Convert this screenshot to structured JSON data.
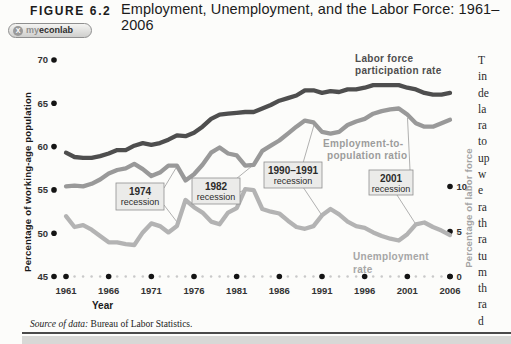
{
  "figure": {
    "label": "FIGURE 6.2",
    "title": "Employment, Unemployment, and the Labor Force: 1961–2006",
    "badge": {
      "mark": "X",
      "prefix": "my",
      "mid": "econ",
      "suffix": "lab"
    },
    "source_prefix": "Source of data:",
    "source_text": "Bureau of Labor Statistics."
  },
  "chart_data": {
    "type": "line",
    "title": "Employment, Unemployment, and the Labor Force: 1961–2006",
    "years": [
      1961,
      1962,
      1963,
      1964,
      1965,
      1966,
      1967,
      1968,
      1969,
      1970,
      1971,
      1972,
      1973,
      1974,
      1975,
      1976,
      1977,
      1978,
      1979,
      1980,
      1981,
      1982,
      1983,
      1984,
      1985,
      1986,
      1987,
      1988,
      1989,
      1990,
      1991,
      1992,
      1993,
      1994,
      1995,
      1996,
      1997,
      1998,
      1999,
      2000,
      2001,
      2002,
      2003,
      2004,
      2005,
      2006
    ],
    "series": [
      {
        "name": "Labor force participation rate",
        "axis": "left",
        "color": "#4e4e4e",
        "values": [
          59.3,
          58.8,
          58.7,
          58.7,
          58.9,
          59.2,
          59.6,
          59.6,
          60.1,
          60.4,
          60.2,
          60.4,
          60.8,
          61.3,
          61.2,
          61.6,
          62.3,
          63.2,
          63.7,
          63.8,
          63.9,
          64.0,
          64.0,
          64.4,
          64.8,
          65.3,
          65.6,
          65.9,
          66.5,
          66.5,
          66.2,
          66.4,
          66.3,
          66.6,
          66.6,
          66.8,
          67.1,
          67.1,
          67.1,
          67.1,
          66.8,
          66.6,
          66.2,
          66.0,
          66.0,
          66.2
        ]
      },
      {
        "name": "Employment-to-population ratio",
        "axis": "left",
        "color": "#999999",
        "values": [
          55.4,
          55.5,
          55.4,
          55.7,
          56.2,
          56.9,
          57.3,
          57.5,
          58.0,
          57.4,
          56.6,
          57.0,
          57.8,
          57.8,
          56.1,
          56.8,
          57.9,
          59.3,
          59.9,
          59.2,
          59.0,
          57.8,
          57.9,
          59.5,
          60.1,
          60.7,
          61.5,
          62.3,
          63.0,
          62.8,
          61.7,
          61.5,
          61.7,
          62.5,
          62.9,
          63.2,
          63.8,
          64.1,
          64.3,
          64.4,
          63.7,
          62.7,
          62.3,
          62.3,
          62.7,
          63.1
        ]
      },
      {
        "name": "Unemployment rate",
        "axis": "right",
        "color": "#b3b3b3",
        "values": [
          6.7,
          5.5,
          5.7,
          5.2,
          4.5,
          3.8,
          3.8,
          3.6,
          3.5,
          4.9,
          5.9,
          5.6,
          4.9,
          5.6,
          8.5,
          7.7,
          7.1,
          6.1,
          5.8,
          7.1,
          7.6,
          9.7,
          9.6,
          7.5,
          7.2,
          7.0,
          6.2,
          5.5,
          5.3,
          5.6,
          6.8,
          7.5,
          6.9,
          6.1,
          5.6,
          5.4,
          4.9,
          4.5,
          4.2,
          4.0,
          4.7,
          5.8,
          6.0,
          5.5,
          5.1,
          4.6
        ]
      }
    ],
    "left_axis": {
      "label": "Percentage of working-age population",
      "ticks": [
        70,
        65,
        60,
        55,
        50,
        45
      ],
      "range": [
        45,
        70
      ]
    },
    "right_axis": {
      "label": "Percentage of labor force",
      "ticks": [
        0,
        5,
        10
      ],
      "range": [
        0,
        12.5
      ]
    },
    "x_axis": {
      "label": "Year",
      "major_ticks": [
        1961,
        1966,
        1971,
        1976,
        1981,
        1986,
        1991,
        1996,
        2001,
        2006
      ],
      "range": [
        1961,
        2006
      ]
    },
    "series_labels": {
      "lfpr": [
        "Labor force",
        "participation rate"
      ],
      "epr": [
        "Employment-to-",
        "population ratio"
      ],
      "ur": [
        "Unemployment",
        "rate"
      ]
    },
    "annotations": [
      {
        "line1": "1974",
        "line2": "recession"
      },
      {
        "line1": "1982",
        "line2": "recession"
      },
      {
        "line1": "1990–1991",
        "line2": "recession"
      },
      {
        "line1": "2001",
        "line2": "recession"
      }
    ],
    "grid": false,
    "legend_position": "inline-labels"
  },
  "side_text": {
    "fragments": [
      "T",
      "in",
      "de",
      "la",
      "ra",
      "to",
      "up",
      "w",
      "e",
      "ra",
      "th",
      "ra",
      "tu",
      "m",
      "th",
      "ra",
      "d"
    ]
  }
}
